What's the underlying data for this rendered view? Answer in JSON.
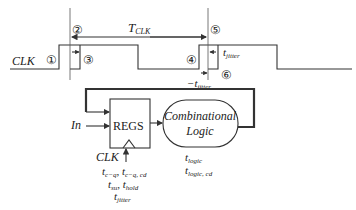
{
  "timing": {
    "clk_label": "CLK",
    "period_label_main": "T",
    "period_label_sub": "CLK",
    "markers": [
      "①",
      "②",
      "③",
      "④",
      "⑤",
      "⑥"
    ],
    "jitter_plus_main": "t",
    "jitter_plus_sub": "jitter",
    "jitter_minus_main": "−t",
    "jitter_minus_sub": "jitter"
  },
  "circuit": {
    "input_label": "In",
    "register_label": "REGS",
    "clk_label": "CLK",
    "logic_label_line1": "Combinational",
    "logic_label_line2": "Logic",
    "register_params": [
      {
        "main": "t",
        "sub": "c−q",
        "sep": ", ",
        "main2": "t",
        "sub2": "c−q, cd"
      },
      {
        "main": "t",
        "sub": "su",
        "sep": ", ",
        "main2": "t",
        "sub2": "hold"
      },
      {
        "main": "t",
        "sub": "jitter"
      }
    ],
    "logic_params": [
      {
        "main": "t",
        "sub": "logic"
      },
      {
        "main": "t",
        "sub": "logic, cd"
      }
    ]
  },
  "colors": {
    "line": "#333333",
    "background": "#ffffff"
  }
}
